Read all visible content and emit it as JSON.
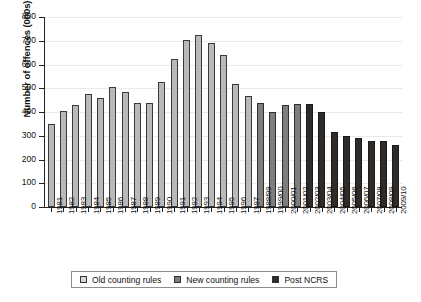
{
  "chart_data": {
    "type": "bar",
    "title": "",
    "xlabel": "",
    "ylabel": "Number of offences (000s)",
    "ylim": [
      0,
      800
    ],
    "ytick_step": 100,
    "yticks": [
      800,
      700,
      600,
      500,
      400,
      300,
      200,
      100,
      0
    ],
    "grid": true,
    "legend_position": "bottom",
    "categories": [
      "1981",
      "1982",
      "1983",
      "1984",
      "1985",
      "1986",
      "1987",
      "1988",
      "1989",
      "1990",
      "1991",
      "1992",
      "1993",
      "1994",
      "1995",
      "1996",
      "1997",
      "1988/99",
      "1999/00",
      "2000/01",
      "2001/02",
      "2002/03",
      "2003/04",
      "2004/05",
      "2005/06",
      "2006/07",
      "2007/08",
      "2008/09",
      "2009/10"
    ],
    "values": [
      350,
      405,
      430,
      475,
      458,
      505,
      485,
      438,
      438,
      528,
      625,
      705,
      725,
      690,
      640,
      518,
      468,
      440,
      400,
      428,
      433,
      433,
      398,
      315,
      297,
      291,
      278,
      280,
      262
    ],
    "groups": [
      "old",
      "old",
      "old",
      "old",
      "old",
      "old",
      "old",
      "old",
      "old",
      "old",
      "old",
      "old",
      "old",
      "old",
      "old",
      "old",
      "old",
      "new",
      "new",
      "new",
      "new",
      "ncrs",
      "ncrs",
      "ncrs",
      "ncrs",
      "ncrs",
      "ncrs",
      "ncrs",
      "ncrs"
    ],
    "legend": [
      {
        "key": "old",
        "label": "Old counting rules",
        "color": "#b9b9b9"
      },
      {
        "key": "new",
        "label": "New counting rules",
        "color": "#7e7e7e"
      },
      {
        "key": "ncrs",
        "label": "Post NCRS",
        "color": "#2f2b29"
      }
    ]
  }
}
